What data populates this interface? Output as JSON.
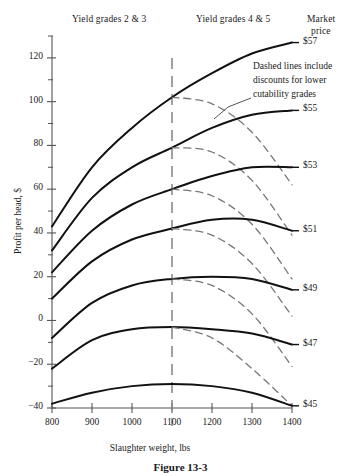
{
  "headers": {
    "yield_grades_left": "Yield grades 2 & 3",
    "yield_grades_right": "Yield grades 4 & 5",
    "market_line1": "Market",
    "market_line2": "price"
  },
  "annotation": {
    "line1": "Dashed lines include",
    "line2": "discounts for lower",
    "line3": "cutability grades"
  },
  "caption": "Figure 13-3",
  "chart_data": {
    "type": "line",
    "title": "",
    "xlabel": "Slaughter weight, lbs",
    "ylabel": "Profit per head, $",
    "xlim": [
      800,
      1400
    ],
    "ylim": [
      -40,
      130
    ],
    "xticks": [
      800,
      900,
      1000,
      1100,
      1200,
      1300,
      1400
    ],
    "yticks": [
      -40,
      -20,
      0,
      20,
      40,
      60,
      80,
      100,
      120
    ],
    "yminorticks": [
      -30,
      -10,
      10,
      30,
      50,
      70,
      90,
      110,
      130
    ],
    "grid": false,
    "legend_position": "right-end-labels",
    "divider_x": 1100,
    "divider_style": "dashed-vertical",
    "series": [
      {
        "name": "$57",
        "label": "$57",
        "style": "solid",
        "x": [
          800,
          900,
          1000,
          1100,
          1200,
          1300,
          1400
        ],
        "values": [
          43,
          70,
          88,
          102,
          113,
          122,
          127
        ]
      },
      {
        "name": "$57 discounted",
        "label": "",
        "style": "dashed",
        "x": [
          1100,
          1200,
          1300,
          1400
        ],
        "values": [
          102,
          99,
          86,
          62
        ]
      },
      {
        "name": "$55",
        "label": "$55",
        "style": "solid",
        "x": [
          800,
          900,
          1000,
          1100,
          1200,
          1300,
          1400
        ],
        "values": [
          32,
          56,
          70,
          79,
          88,
          94,
          96
        ]
      },
      {
        "name": "$55 discounted",
        "label": "",
        "style": "dashed",
        "x": [
          1100,
          1200,
          1300,
          1400
        ],
        "values": [
          79,
          77,
          64,
          39
        ]
      },
      {
        "name": "$53",
        "label": "$53",
        "style": "solid",
        "x": [
          800,
          900,
          1000,
          1100,
          1200,
          1300,
          1400
        ],
        "values": [
          22,
          41,
          53,
          60,
          66,
          70,
          70
        ]
      },
      {
        "name": "$53 discounted",
        "label": "",
        "style": "dashed",
        "x": [
          1100,
          1200,
          1300,
          1400
        ],
        "values": [
          60,
          57,
          44,
          19
        ]
      },
      {
        "name": "$51",
        "label": "$51",
        "style": "solid",
        "x": [
          800,
          900,
          1000,
          1100,
          1200,
          1300,
          1400
        ],
        "values": [
          10,
          27,
          37,
          42,
          46,
          46,
          41
        ]
      },
      {
        "name": "$51 discounted",
        "label": "",
        "style": "dashed",
        "x": [
          1100,
          1200,
          1300,
          1400
        ],
        "values": [
          42,
          39,
          26,
          2
        ]
      },
      {
        "name": "$49",
        "label": "$49",
        "style": "solid",
        "x": [
          800,
          900,
          1000,
          1100,
          1200,
          1300,
          1400
        ],
        "values": [
          -8,
          8,
          16,
          19,
          20,
          19,
          14
        ]
      },
      {
        "name": "$49 discounted",
        "label": "",
        "style": "dashed",
        "x": [
          1100,
          1200,
          1300,
          1400
        ],
        "values": [
          19,
          16,
          3,
          -21
        ]
      },
      {
        "name": "$47",
        "label": "$47",
        "style": "solid",
        "x": [
          800,
          900,
          1000,
          1100,
          1200,
          1300,
          1400
        ],
        "values": [
          -22,
          -9,
          -4,
          -3,
          -4,
          -6,
          -11
        ]
      },
      {
        "name": "$47 discounted",
        "label": "",
        "style": "dashed",
        "x": [
          1100,
          1200,
          1300,
          1400
        ],
        "values": [
          -3,
          -8,
          -22,
          -39
        ]
      },
      {
        "name": "$45",
        "label": "$45",
        "style": "solid",
        "x": [
          800,
          900,
          1000,
          1100,
          1200,
          1300,
          1400
        ],
        "values": [
          -38,
          -33,
          -30,
          -29,
          -30,
          -33,
          -39
        ]
      }
    ]
  }
}
